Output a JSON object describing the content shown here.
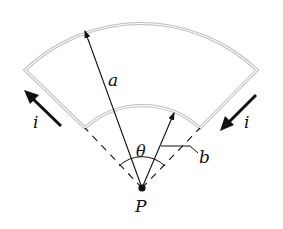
{
  "diagram": {
    "type": "circuit-loop-sector",
    "colors": {
      "wire": "#bdbdbd",
      "wire_inner": "#ffffff",
      "ink": "#111111",
      "background": "#ffffff"
    },
    "labels": {
      "outer_radius": "a",
      "inner_radius": "b",
      "angle": "θ",
      "center_point": "P",
      "current_left": "i",
      "current_right": "i"
    },
    "geometry": {
      "center": [
        142,
        188
      ],
      "outer_radius_px": 168,
      "inner_radius_px": 85,
      "half_angle_deg": 44
    }
  }
}
